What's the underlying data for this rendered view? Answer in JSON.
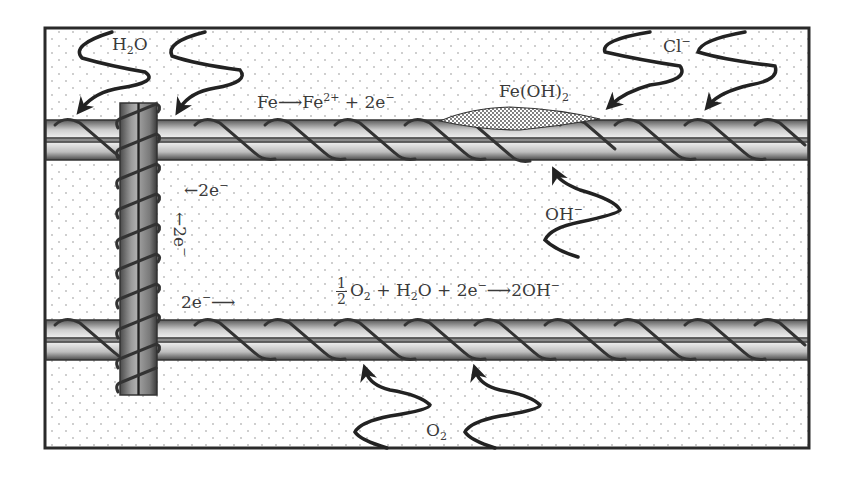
{
  "diagram": {
    "colors": {
      "frame": "#2a2a2a",
      "concrete_dots": "#b8b8b8",
      "rebar_light": "#e6e6e6",
      "rebar_dark": "#5a5a5a",
      "stirrup": "#7a7a7a",
      "arrow": "#222222",
      "text": "#3a3a3a"
    },
    "labels": {
      "water": {
        "base": "H",
        "sub": "2",
        "tail": "O"
      },
      "chloride": {
        "base": "Cl",
        "sup": "−"
      },
      "anodic_reaction": {
        "left": "Fe",
        "arrow": "⟶",
        "mid": "Fe",
        "mid_sup": "2+",
        "right": " + 2e",
        "right_sup": "−"
      },
      "rust_product": {
        "base": "Fe(OH)",
        "sub": "2"
      },
      "hydroxide": {
        "base": "OH",
        "sup": "−"
      },
      "electron_flow_top": {
        "arrow": "←",
        "text": "2e",
        "sup": "−"
      },
      "electron_flow_vertical": {
        "arrow": "←",
        "text": "2e",
        "sup": "−"
      },
      "electron_flow_bottom": {
        "text": "2e",
        "sup": "−",
        "arrow": "⟶"
      },
      "cathodic_reaction": {
        "frac_num": "1",
        "frac_den": "2",
        "o2": "O",
        "o2_sub": "2",
        "plus1": " + H",
        "h2o_sub": "2",
        "h2o_tail": "O",
        "plus2": " + 2e",
        "e_sup": "−",
        "arrow": "⟶",
        "product": "2OH",
        "product_sup": "−"
      },
      "oxygen": {
        "base": "O",
        "sub": "2"
      }
    },
    "elements": {
      "top_rebar": {
        "role": "anode"
      },
      "bottom_rebar": {
        "role": "cathode"
      },
      "stirrup": {
        "role": "electrical connection"
      },
      "rust_deposit": {
        "material": "Fe(OH)2"
      }
    }
  }
}
